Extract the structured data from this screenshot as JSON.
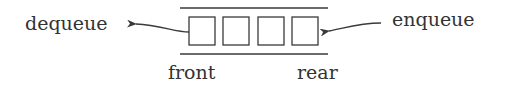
{
  "diagram": {
    "title": "Queue",
    "labels": {
      "dequeue": "dequeue",
      "enqueue": "enqueue",
      "front": "front",
      "rear": "rear"
    },
    "cells": [
      {
        "index": 0,
        "value": ""
      },
      {
        "index": 1,
        "value": ""
      },
      {
        "index": 2,
        "value": ""
      },
      {
        "index": 3,
        "value": ""
      }
    ],
    "arrows": [
      {
        "from": "front-cell",
        "to": "dequeue",
        "direction": "left"
      },
      {
        "from": "enqueue",
        "to": "rear-cell",
        "direction": "left"
      }
    ],
    "colors": {
      "stroke": "#3a3a3a",
      "text": "#333333",
      "background": "#ffffff"
    }
  }
}
